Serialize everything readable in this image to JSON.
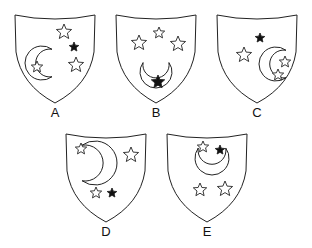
{
  "figure": {
    "stroke_color": "#222222",
    "fill_color": "#ffffff",
    "filled_star_color": "#111111"
  },
  "shields": [
    {
      "label": "A",
      "cx": 55,
      "top": 15,
      "tip": 103,
      "moon": {
        "x": 42,
        "y": 63,
        "r": 17,
        "orientation": "opens-right"
      },
      "stars": [
        {
          "x": 64,
          "y": 32,
          "r": 8,
          "filled": false
        },
        {
          "x": 74,
          "y": 47,
          "r": 5,
          "filled": true
        },
        {
          "x": 76,
          "y": 65,
          "r": 8,
          "filled": false
        },
        {
          "x": 37,
          "y": 67,
          "r": 6,
          "filled": false
        }
      ]
    },
    {
      "label": "B",
      "cx": 156,
      "top": 15,
      "tip": 103,
      "moon": {
        "x": 156,
        "y": 72,
        "r": 16,
        "orientation": "opens-up"
      },
      "stars": [
        {
          "x": 139,
          "y": 43,
          "r": 8,
          "filled": false
        },
        {
          "x": 159,
          "y": 33,
          "r": 6,
          "filled": false
        },
        {
          "x": 178,
          "y": 44,
          "r": 8,
          "filled": false
        },
        {
          "x": 158,
          "y": 82,
          "r": 7,
          "filled": true
        }
      ]
    },
    {
      "label": "C",
      "cx": 257,
      "top": 15,
      "tip": 103,
      "moon": {
        "x": 276,
        "y": 64,
        "r": 17,
        "orientation": "opens-right"
      },
      "stars": [
        {
          "x": 260,
          "y": 38,
          "r": 5,
          "filled": true
        },
        {
          "x": 244,
          "y": 55,
          "r": 8,
          "filled": false
        },
        {
          "x": 285,
          "y": 62,
          "r": 6,
          "filled": false
        },
        {
          "x": 278,
          "y": 75,
          "r": 6,
          "filled": false
        }
      ]
    },
    {
      "label": "D",
      "cx": 106,
      "top": 134,
      "tip": 222,
      "moon": {
        "x": 95,
        "y": 163,
        "r": 22,
        "orientation": "opens-left"
      },
      "stars": [
        {
          "x": 81,
          "y": 149,
          "r": 6,
          "filled": false
        },
        {
          "x": 131,
          "y": 155,
          "r": 8,
          "filled": false
        },
        {
          "x": 96,
          "y": 193,
          "r": 6,
          "filled": false
        },
        {
          "x": 112,
          "y": 193,
          "r": 5,
          "filled": true
        }
      ]
    },
    {
      "label": "E",
      "cx": 207,
      "top": 134,
      "tip": 222,
      "moon": {
        "x": 212,
        "y": 158,
        "r": 17,
        "orientation": "opens-up"
      },
      "stars": [
        {
          "x": 203,
          "y": 147,
          "r": 6,
          "filled": false
        },
        {
          "x": 220,
          "y": 150,
          "r": 5,
          "filled": true
        },
        {
          "x": 200,
          "y": 190,
          "r": 7,
          "filled": false
        },
        {
          "x": 225,
          "y": 189,
          "r": 8,
          "filled": false
        }
      ]
    }
  ]
}
